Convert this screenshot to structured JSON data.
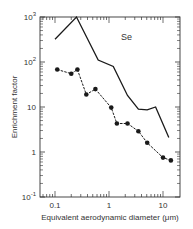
{
  "chart_data": {
    "type": "line",
    "title": "",
    "annotation": "Se",
    "xlabel": "Equivalent aerodynamic diameter (μm)",
    "ylabel": "Enrichment factor",
    "xscale": "log",
    "yscale": "log",
    "xlim": [
      0.06,
      20
    ],
    "ylim": [
      0.1,
      1000
    ],
    "grid": false,
    "legend": null,
    "x_ticks": [
      "0.1",
      "1",
      "10"
    ],
    "y_ticks": [
      {
        "base": "10",
        "exp": "-1"
      },
      {
        "base": "1",
        "exp": ""
      },
      {
        "base": "10",
        "exp": ""
      },
      {
        "base": "10",
        "exp": "2"
      },
      {
        "base": "10",
        "exp": "3"
      }
    ],
    "series": [
      {
        "name": "upper (solid line, no markers)",
        "marker": "none",
        "linestyle": "solid",
        "x": [
          0.1,
          0.25,
          0.63,
          1.2,
          2.2,
          3.5,
          5.1,
          7.3,
          12.8
        ],
        "y": [
          320,
          1000,
          110,
          80,
          18,
          9.0,
          8.6,
          10,
          2.1
        ]
      },
      {
        "name": "lower (dashed line, filled circles)",
        "marker": "circle",
        "linestyle": "dashed",
        "x": [
          0.11,
          0.2,
          0.26,
          0.38,
          0.56,
          1.1,
          1.4,
          2.2,
          3.5,
          5.1,
          10,
          14
        ],
        "y": [
          68,
          55,
          68,
          19,
          25,
          9.7,
          4.3,
          4.3,
          2.9,
          1.6,
          0.75,
          0.65
        ]
      }
    ]
  },
  "colors": {
    "line": "#1a1a1a",
    "axis": "#333333",
    "background": "#ffffff"
  }
}
